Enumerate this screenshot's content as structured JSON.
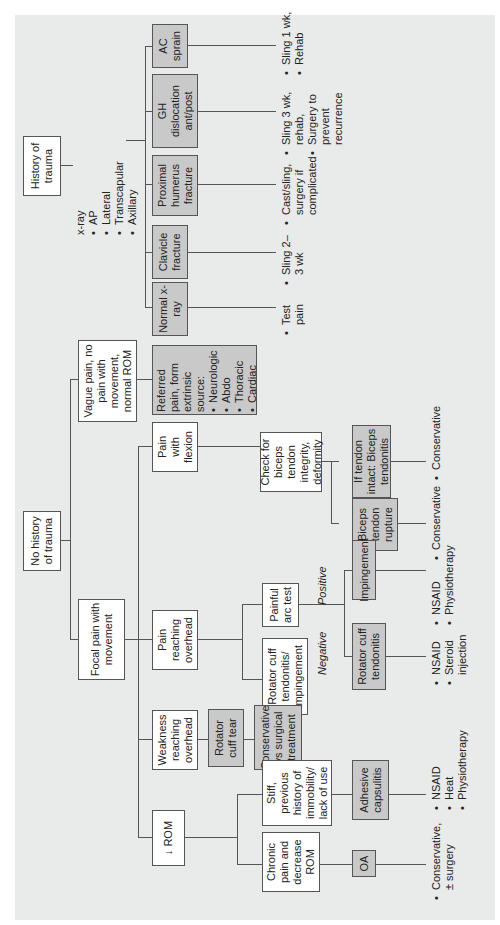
{
  "diagram": {
    "orientation": "rotated -90deg (text reads bottom to top)",
    "colors": {
      "background": "#e9eaea",
      "white_box": "#ffffff",
      "grey_box": "#c9c9c9",
      "line": "#555555"
    },
    "trauma": {
      "root": "History of trauma",
      "xray": {
        "label": "x-ray",
        "views": [
          "AP",
          "Lateral",
          "Transcapular",
          "Axillary"
        ]
      },
      "branches": [
        {
          "label": "AC sprain",
          "treatment": [
            "Sling 1 wk,",
            "Rehab"
          ]
        },
        {
          "label": "GH dislocation ant/post",
          "treatment": [
            "Sling 3 wk, rehab,",
            "Surgery to prevent recurrence"
          ]
        },
        {
          "label": "Proximal humerus fracture",
          "treatment": [
            "Cast/sling, surgery if complicated"
          ]
        },
        {
          "label": "Clavicle fracture",
          "treatment": [
            "Sling 2–3 wk"
          ]
        },
        {
          "label": "Normal x-ray",
          "treatment": [
            "Test pain"
          ]
        }
      ]
    },
    "no_trauma": {
      "root": "No history of trauma",
      "vague": {
        "label": "Vague pain, no pain with movement, normal ROM",
        "referred": {
          "title": "Referred pain, form extrinsic source:",
          "items": [
            "Neurologic",
            "Abdo",
            "Thoracic",
            "Cardiac"
          ]
        }
      },
      "focal": {
        "label": "Focal pain with movement",
        "flexion": {
          "label": "Pain with flexion",
          "check": "Check for biceps tendon integrity, deformity",
          "intact": {
            "label": "If tendon intact: Biceps tendonitis",
            "treatment": [
              "Conservative"
            ]
          },
          "rupture": {
            "label": "Biceps tendon rupture",
            "treatment": [
              "Conservative"
            ]
          }
        },
        "overhead": {
          "label": "Pain reaching overhead",
          "arc": "Painful arc test",
          "positive_label": "Positive",
          "negative_label": "Negative",
          "impingement": {
            "label": "Impingement",
            "treatment": [
              "NSAID",
              "Physiotherapy"
            ]
          },
          "rc_tendonitis": {
            "label": "Rotator cuff tendonitis",
            "treatment": [
              "NSAID",
              "Steroid injection"
            ]
          },
          "rc_tend_imp": "Rotator cuff tendonitis/ impingement"
        },
        "weakness": {
          "label": "Weakness reaching overhead",
          "tear": "Rotator cuff tear",
          "treatment": "Conservative vs surgical treatment"
        },
        "rom": {
          "label": "↓ ROM",
          "stiff": {
            "label": "Stiff, previous history of immobility/ lack of use",
            "dx": "Adhesive capsulitis",
            "treatment": [
              "NSAID",
              "Heat",
              "Physiotherapy"
            ]
          },
          "chronic": {
            "label": "Chronic pain and decrease ROM",
            "dx": "OA",
            "treatment": [
              "Conservative, ± surgery"
            ]
          }
        }
      }
    }
  }
}
